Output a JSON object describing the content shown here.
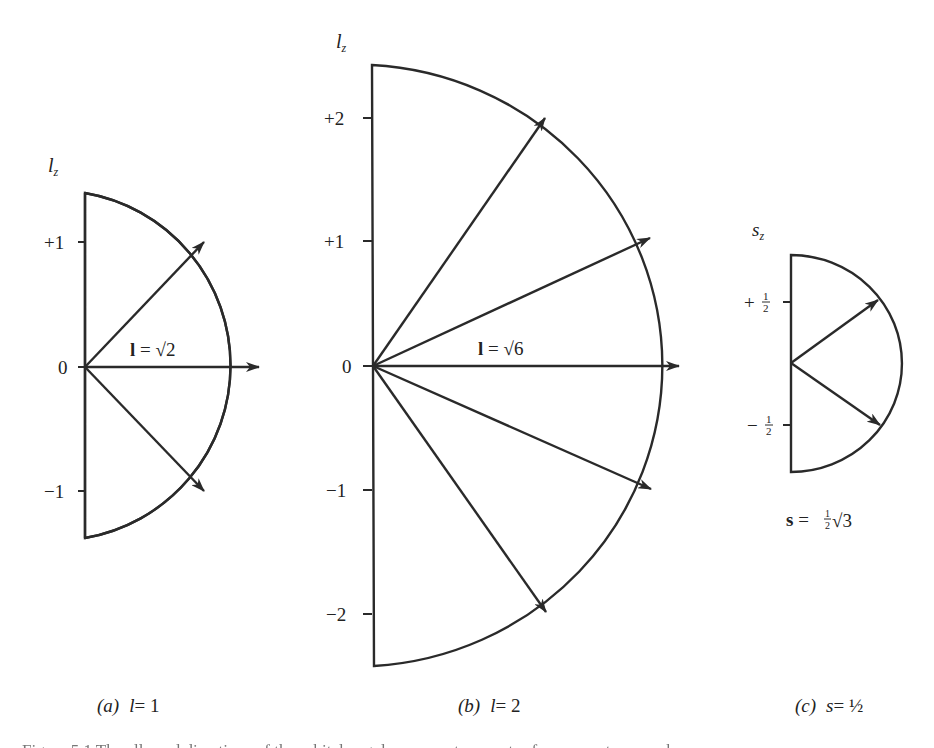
{
  "figure": {
    "stroke_color": "#2a2a2a",
    "panels": [
      {
        "id": "a",
        "axis_label_main": "l",
        "axis_label_sub": "z",
        "ticks": [
          {
            "label": "+1",
            "value": 1
          },
          {
            "label": "0",
            "value": 0
          },
          {
            "label": "−1",
            "value": -1
          }
        ],
        "vector_label": "l = √2",
        "vector_label_parts": {
          "bold": "l",
          "eq": " = ",
          "root": "√",
          "num": "2"
        },
        "caption_prefix": "(a)",
        "caption_var": "l",
        "caption_value": "= 1",
        "center": [
          85,
          367
        ],
        "radius": 175,
        "unit_px": 125,
        "m_values": [
          1,
          0,
          -1
        ]
      },
      {
        "id": "b",
        "axis_label_main": "l",
        "axis_label_sub": "z",
        "ticks": [
          {
            "label": "+2",
            "value": 2
          },
          {
            "label": "+1",
            "value": 1
          },
          {
            "label": "0",
            "value": 0
          },
          {
            "label": "−1",
            "value": -1
          },
          {
            "label": "−2",
            "value": -2
          }
        ],
        "vector_label": "l = √6",
        "vector_label_parts": {
          "bold": "l",
          "eq": " = ",
          "root": "√",
          "num": "6"
        },
        "caption_prefix": "(b)",
        "caption_var": "l",
        "caption_value": "= 2",
        "center": [
          373,
          366
        ],
        "radius": 307,
        "unit_px": 124,
        "m_values": [
          2,
          1,
          0,
          -1,
          -2
        ]
      },
      {
        "id": "c",
        "axis_label_main": "s",
        "axis_label_sub": "z",
        "ticks": [
          {
            "label": "+½",
            "sign": "+",
            "num": "1",
            "den": "2",
            "value": 0.5
          },
          {
            "label": "−½",
            "sign": "−",
            "num": "1",
            "den": "2",
            "value": -0.5
          }
        ],
        "vector_label": "s = ½√3",
        "vector_label_parts": {
          "bold": "s",
          "eq": " = ",
          "frac_num": "1",
          "frac_den": "2",
          "root": "√",
          "num": "3"
        },
        "caption_prefix": "(c)",
        "caption_var": "s",
        "caption_value": "= ½",
        "center": [
          791,
          363
        ],
        "radius": 110,
        "unit_px": 123,
        "m_values": [
          0.5,
          -0.5
        ]
      }
    ],
    "caption_text": "Figure 5.1  The allowed directions of the orbital angular momentum vector for ... quantum number ..."
  }
}
